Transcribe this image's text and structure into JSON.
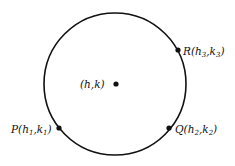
{
  "diagram": {
    "type": "circle-through-three-points",
    "circle": {
      "cx": 115,
      "cy": 84,
      "r": 71,
      "stroke": "#111111",
      "stroke_width": 1.6
    },
    "center": {
      "x": 116,
      "y": 84,
      "label": "(h,k)",
      "label_x": 80,
      "label_y": 88
    },
    "points": [
      {
        "name": "R",
        "x": 178,
        "y": 50,
        "label": "R(h3,k3)",
        "letter": "R",
        "h": "h",
        "hsub": "3",
        "k": "k",
        "ksub": "3",
        "label_x": 183,
        "label_y": 55
      },
      {
        "name": "P",
        "x": 59,
        "y": 128,
        "label": "P(h1,k1)",
        "letter": "P",
        "h": "h",
        "hsub": "1",
        "k": "k",
        "ksub": "1",
        "label_x": 11,
        "label_y": 133
      },
      {
        "name": "Q",
        "x": 169,
        "y": 128,
        "label": "Q(h2,k2)",
        "letter": "Q",
        "h": "h",
        "hsub": "2",
        "k": "k",
        "ksub": "2",
        "label_x": 175,
        "label_y": 133
      }
    ],
    "colors": {
      "line": "#111111",
      "background": "#ffffff"
    }
  }
}
